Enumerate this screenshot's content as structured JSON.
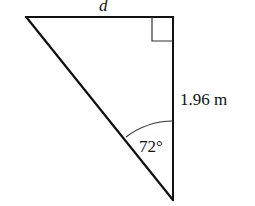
{
  "diagram": {
    "type": "right-triangle",
    "stroke_color": "#111111",
    "background_color": "#ffffff",
    "vertices": {
      "top_left": [
        26,
        17
      ],
      "right_angle": [
        173,
        17
      ],
      "bottom": [
        173,
        200
      ]
    },
    "labels": {
      "top_side": "d",
      "vertical_side": "1.96 m",
      "angle": "72°"
    },
    "right_angle_marker": true,
    "angle_arc_at": "bottom"
  }
}
